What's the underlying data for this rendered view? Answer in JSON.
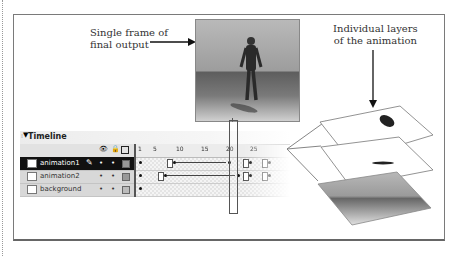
{
  "captions": {
    "left_line1": "Single frame of",
    "left_line2": "final output",
    "right_line1": "Individual layers",
    "right_line2": "of the animation"
  },
  "timeline": {
    "title": "Timeline",
    "header_icons": [
      "eye-icon",
      "lock-icon",
      "outline-icon"
    ],
    "ruler_ticks": [
      "1",
      "5",
      "10",
      "15",
      "20",
      "25"
    ],
    "current_frame": 23,
    "layers": [
      {
        "name": "animation1",
        "selected": true,
        "edit_icon": "pencil-icon"
      },
      {
        "name": "animation2",
        "selected": false
      },
      {
        "name": "background",
        "selected": false
      }
    ]
  },
  "layer_stack": [
    "animation1",
    "animation2",
    "background"
  ]
}
